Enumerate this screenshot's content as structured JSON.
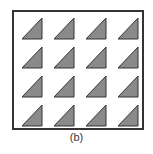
{
  "figure": {
    "caption": "(b)",
    "grid": {
      "rows": 4,
      "cols": 4
    },
    "shape": "right-triangle",
    "right_angle_corner": "bottom-right",
    "fill_color": "#8a8a8a",
    "stroke_color": "#333333",
    "frame_color": "#333333"
  }
}
